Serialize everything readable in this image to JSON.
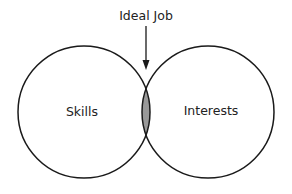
{
  "diagram": {
    "type": "venn",
    "annotation": "Ideal Job",
    "sets": [
      {
        "label": "Skills"
      },
      {
        "label": "Interests"
      }
    ],
    "intersection_fill": "#999999",
    "stroke": "#1a1a1a"
  }
}
